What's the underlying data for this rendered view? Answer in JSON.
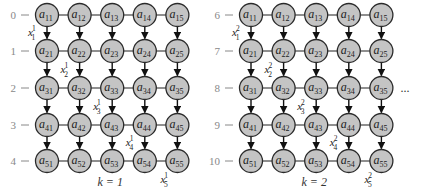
{
  "panels": [
    {
      "k_label": "k = 1",
      "row_labels": [
        "0",
        "1",
        "2",
        "3",
        "4"
      ],
      "x_labels": [
        {
          "base": "x",
          "sub": "1",
          "sup": "1"
        },
        {
          "base": "x",
          "sub": "2",
          "sup": "1"
        },
        {
          "base": "x",
          "sub": "3",
          "sup": "1"
        },
        {
          "base": "x",
          "sub": "4",
          "sup": "1"
        },
        {
          "base": "x",
          "sub": "5",
          "sup": "1"
        }
      ]
    },
    {
      "k_label": "k = 2",
      "row_labels": [
        "6",
        "7",
        "8",
        "9",
        "10"
      ],
      "x_labels": [
        {
          "base": "x",
          "sub": "1",
          "sup": "2"
        },
        {
          "base": "x",
          "sub": "2",
          "sup": "2"
        },
        {
          "base": "x",
          "sub": "3",
          "sup": "2"
        },
        {
          "base": "x",
          "sub": "4",
          "sup": "2"
        },
        {
          "base": "x",
          "sub": "5",
          "sup": "2"
        }
      ]
    }
  ],
  "node_base": "a",
  "node_indices": [
    [
      "11",
      "12",
      "13",
      "14",
      "15"
    ],
    [
      "21",
      "22",
      "23",
      "24",
      "25"
    ],
    [
      "31",
      "32",
      "33",
      "34",
      "35"
    ],
    [
      "41",
      "42",
      "43",
      "44",
      "45"
    ],
    [
      "51",
      "52",
      "53",
      "54",
      "55"
    ]
  ],
  "continuation": "...",
  "colors": {
    "node_fill": "#c4c4c4",
    "node_stroke": "#2a2a2a",
    "row_label": "#888888",
    "arrow": "#111111"
  }
}
